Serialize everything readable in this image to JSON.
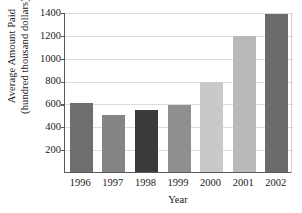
{
  "chart_data": {
    "type": "bar",
    "title": "",
    "xlabel": "Year",
    "ylabel": "Average Amount Paid (hundred thousand dollars)",
    "ylabel_lines": [
      "Average Amount Paid",
      "(hundred thousand dollars)"
    ],
    "categories": [
      "1996",
      "1997",
      "1998",
      "1999",
      "2000",
      "2001",
      "2002"
    ],
    "values": [
      600,
      495,
      545,
      590,
      790,
      1190,
      1385
    ],
    "ylim": [
      0,
      1400
    ],
    "yticks": [
      200,
      400,
      600,
      800,
      1000,
      1200,
      1400
    ],
    "ytick_labels": [
      "200",
      "400",
      "600",
      "800",
      "1000",
      "1200",
      "1400"
    ],
    "grid": "horizontal",
    "legend": "none",
    "bar_colors": [
      "#6e6e6e",
      "#848484",
      "#3a3a3a",
      "#8f8f8f",
      "#c9c9c9",
      "#b9b9b9",
      "#6b6b6b"
    ],
    "colors": {
      "axis": "#5a5a5a",
      "gridline": "#dcdcdc",
      "text": "#1a1a1a",
      "background": "#ffffff"
    }
  }
}
